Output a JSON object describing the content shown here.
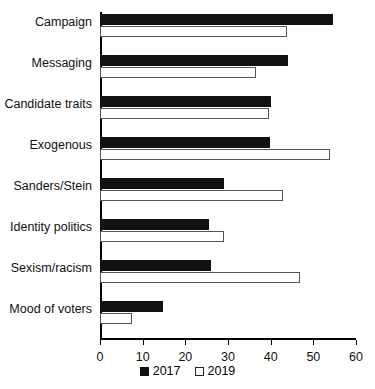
{
  "chart_data": {
    "type": "bar",
    "orientation": "horizontal",
    "title": "",
    "xlabel": "",
    "ylabel": "",
    "xlim": [
      0,
      60
    ],
    "xticks": [
      0,
      10,
      20,
      30,
      40,
      50,
      60
    ],
    "xtick_labels": [
      "0",
      "10",
      "20",
      "30",
      "40",
      "50",
      "60"
    ],
    "grid": false,
    "legend_position": "bottom-center",
    "categories": [
      "Campaign",
      "Messaging",
      "Candidate traits",
      "Exogenous",
      "Sanders/Stein",
      "Identity politics",
      "Sexism/racism",
      "Mood of voters"
    ],
    "series": [
      {
        "name": "2017",
        "color": "#111111",
        "style": "filled",
        "values": [
          54.5,
          44.0,
          40.0,
          39.8,
          29.0,
          25.5,
          26.0,
          14.7
        ]
      },
      {
        "name": "2019",
        "color": "#ffffff",
        "style": "hollow",
        "values": [
          43.8,
          36.5,
          39.6,
          53.9,
          43.0,
          29.0,
          46.8,
          7.5
        ]
      }
    ]
  },
  "legend": {
    "items": [
      {
        "label": "2017",
        "swatch": "filled-square-icon"
      },
      {
        "label": "2019",
        "swatch": "hollow-square-icon"
      }
    ]
  }
}
